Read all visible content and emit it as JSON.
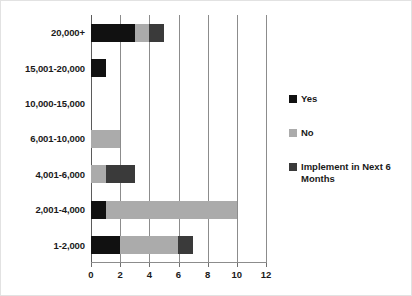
{
  "chart_data": {
    "type": "bar",
    "orientation": "horizontal",
    "stacked": true,
    "title": "",
    "xlabel": "",
    "ylabel": "",
    "xlim": [
      0,
      12
    ],
    "xticks": [
      0,
      2,
      4,
      6,
      8,
      10,
      12
    ],
    "xtick_labels": [
      "0",
      "2",
      "4",
      "6",
      "8",
      "10",
      "12"
    ],
    "grid": true,
    "grid_axis": "x",
    "legend_position": "right",
    "categories": [
      "20,000+",
      "15,001-20,000",
      "10,000-15,000",
      "6,001-10,000",
      "4,001-6,000",
      "2,001-4,000",
      "1-2,000"
    ],
    "series": [
      {
        "name": "Yes",
        "color": "#111111",
        "values": [
          3,
          1,
          0,
          0,
          0,
          1,
          2
        ]
      },
      {
        "name": "No",
        "color": "#ababab",
        "values": [
          1,
          0,
          0,
          2,
          1,
          9,
          4
        ]
      },
      {
        "name": "Implement in Next 6 Months",
        "color": "#3a3a3a",
        "values": [
          1,
          0,
          0,
          0,
          2,
          0,
          1
        ]
      }
    ]
  },
  "legend": {
    "items": [
      {
        "label": "Yes",
        "color": "#111111"
      },
      {
        "label": "No",
        "color": "#ababab"
      },
      {
        "label": "Implement in Next 6 Months",
        "color": "#3a3a3a"
      }
    ]
  }
}
